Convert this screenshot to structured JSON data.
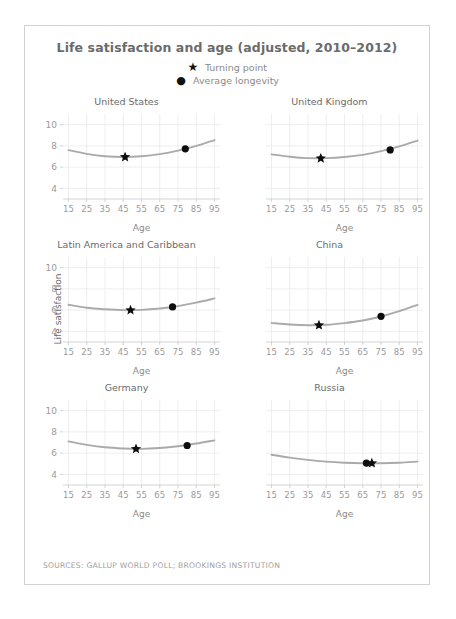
{
  "card": {
    "title": "Life satisfaction and age (adjusted, 2010–2012)",
    "source": "SOURCES: GALLUP WORLD POLL; BROOKINGS INSTITUTION"
  },
  "legend": {
    "items": [
      {
        "marker": "star-icon",
        "glyph": "★",
        "label": "Turning point"
      },
      {
        "marker": "circle-icon",
        "glyph": "●",
        "label": "Average longevity"
      }
    ]
  },
  "axes": {
    "xlabel": "Age",
    "ylabel": "Life satisfaction",
    "xticks": [
      15,
      25,
      35,
      45,
      55,
      65,
      75,
      85,
      95
    ],
    "yticks": [
      4,
      6,
      8,
      10
    ],
    "xlim": [
      12,
      98
    ],
    "ylim": [
      3,
      11
    ]
  },
  "colors": {
    "curve": "#aaaaaa",
    "marker": "#0d0d0d",
    "grid": "#e6e6e6",
    "text": "#6b6b6b",
    "tick": "#9a9a9a",
    "border": "#d2d2d2"
  },
  "chart_data": {
    "type": "line",
    "title": "Life satisfaction and age (adjusted, 2010–2012)",
    "xlabel": "Age",
    "ylabel": "Life satisfaction",
    "xlim": [
      12,
      98
    ],
    "ylim": [
      3,
      11
    ],
    "xticks": [
      15,
      25,
      35,
      45,
      55,
      65,
      75,
      85,
      95
    ],
    "yticks": [
      4,
      6,
      8,
      10
    ],
    "grid": true,
    "legend": [
      "Turning point",
      "Average longevity"
    ],
    "legend_position": "top-center",
    "panels": [
      {
        "name": "United States",
        "show_yticks": true,
        "show_ylabel": false,
        "x": [
          15,
          25,
          35,
          45,
          55,
          65,
          75,
          85,
          95
        ],
        "y": [
          7.6,
          7.25,
          7.02,
          6.95,
          7.02,
          7.22,
          7.55,
          8.0,
          8.55
        ],
        "turning_point": {
          "age": 46,
          "value": 6.95
        },
        "average_longevity": {
          "age": 79,
          "value": 7.72
        }
      },
      {
        "name": "United Kingdom",
        "show_yticks": false,
        "show_ylabel": false,
        "x": [
          15,
          25,
          35,
          45,
          55,
          65,
          75,
          85,
          95
        ],
        "y": [
          7.2,
          6.98,
          6.85,
          6.85,
          6.95,
          7.15,
          7.5,
          7.95,
          8.5
        ],
        "turning_point": {
          "age": 42,
          "value": 6.83
        },
        "average_longevity": {
          "age": 80,
          "value": 7.62
        }
      },
      {
        "name": "Latin America and Caribbean",
        "show_yticks": true,
        "show_ylabel": true,
        "x": [
          15,
          25,
          35,
          45,
          55,
          65,
          75,
          85,
          95
        ],
        "y": [
          6.5,
          6.22,
          6.08,
          6.0,
          6.02,
          6.15,
          6.38,
          6.7,
          7.1
        ],
        "turning_point": {
          "age": 49,
          "value": 6.0
        },
        "average_longevity": {
          "age": 72,
          "value": 6.3
        }
      },
      {
        "name": "China",
        "show_yticks": false,
        "show_ylabel": false,
        "x": [
          15,
          25,
          35,
          45,
          55,
          65,
          75,
          85,
          95
        ],
        "y": [
          4.8,
          4.65,
          4.58,
          4.62,
          4.78,
          5.02,
          5.4,
          5.9,
          6.5
        ],
        "turning_point": {
          "age": 41,
          "value": 4.58
        },
        "average_longevity": {
          "age": 75,
          "value": 5.42
        }
      },
      {
        "name": "Germany",
        "show_yticks": true,
        "show_ylabel": false,
        "x": [
          15,
          25,
          35,
          45,
          55,
          65,
          75,
          85,
          95
        ],
        "y": [
          7.1,
          6.78,
          6.55,
          6.44,
          6.4,
          6.48,
          6.65,
          6.9,
          7.2
        ],
        "turning_point": {
          "age": 52,
          "value": 6.4
        },
        "average_longevity": {
          "age": 80,
          "value": 6.72
        }
      },
      {
        "name": "Russia",
        "show_yticks": false,
        "show_ylabel": false,
        "x": [
          15,
          25,
          35,
          45,
          55,
          65,
          75,
          85,
          95
        ],
        "y": [
          5.85,
          5.58,
          5.36,
          5.2,
          5.1,
          5.05,
          5.05,
          5.1,
          5.2
        ],
        "turning_point": {
          "age": 70,
          "value": 5.05
        },
        "average_longevity": {
          "age": 67,
          "value": 5.06
        }
      }
    ]
  }
}
